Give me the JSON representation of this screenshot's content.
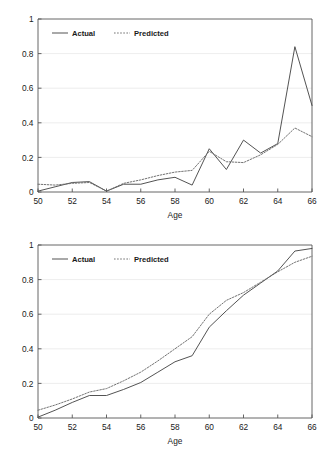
{
  "chart_data": [
    {
      "id": "top",
      "type": "line",
      "title": "",
      "xlabel": "Age",
      "ylabel": "",
      "xlim": [
        50,
        66
      ],
      "ylim": [
        0,
        1
      ],
      "xticks": [
        50,
        52,
        54,
        56,
        58,
        60,
        62,
        64,
        66
      ],
      "xtick_labels": [
        "50",
        "52",
        "54",
        "56",
        "58",
        "60",
        "62",
        "64",
        "66"
      ],
      "yticks": [
        0,
        0.2,
        0.4,
        0.6,
        0.8,
        1
      ],
      "ytick_labels": [
        "0",
        "0.2",
        "0.4",
        "0.6",
        "0.8",
        "1"
      ],
      "grid": "horizontal",
      "legend_position": "top-left",
      "x": [
        50,
        51,
        52,
        53,
        54,
        55,
        56,
        57,
        58,
        59,
        60,
        61,
        62,
        63,
        64,
        65,
        66
      ],
      "series": [
        {
          "name": "Actual",
          "style": "solid",
          "color": "#4a4a4a",
          "values": [
            0.005,
            0.03,
            0.055,
            0.06,
            0.005,
            0.045,
            0.045,
            0.07,
            0.085,
            0.04,
            0.25,
            0.13,
            0.3,
            0.225,
            0.28,
            0.84,
            0.5
          ]
        },
        {
          "name": "Predicted",
          "style": "dotted",
          "color": "#6b6b6b",
          "values": [
            0.045,
            0.04,
            0.05,
            0.055,
            0.005,
            0.05,
            0.07,
            0.095,
            0.115,
            0.125,
            0.235,
            0.175,
            0.17,
            0.215,
            0.275,
            0.37,
            0.32
          ]
        }
      ]
    },
    {
      "id": "bottom",
      "type": "line",
      "title": "",
      "xlabel": "Age",
      "ylabel": "",
      "xlim": [
        50,
        66
      ],
      "ylim": [
        0,
        1
      ],
      "xticks": [
        50,
        52,
        54,
        56,
        58,
        60,
        62,
        64,
        66
      ],
      "xtick_labels": [
        "50",
        "52",
        "54",
        "56",
        "58",
        "60",
        "62",
        "64",
        "66"
      ],
      "yticks": [
        0,
        0.2,
        0.4,
        0.6,
        0.8,
        1
      ],
      "ytick_labels": [
        "0",
        "0.2",
        "0.4",
        "0.6",
        "0.8",
        "1"
      ],
      "grid": "horizontal",
      "legend_position": "top-left",
      "x": [
        50,
        51,
        52,
        53,
        54,
        55,
        56,
        57,
        58,
        59,
        60,
        61,
        62,
        63,
        64,
        65,
        66
      ],
      "series": [
        {
          "name": "Actual",
          "style": "solid",
          "color": "#4a4a4a",
          "values": [
            0.005,
            0.045,
            0.09,
            0.13,
            0.13,
            0.165,
            0.205,
            0.265,
            0.325,
            0.36,
            0.525,
            0.62,
            0.71,
            0.78,
            0.85,
            0.965,
            0.98
          ]
        },
        {
          "name": "Predicted",
          "style": "dotted",
          "color": "#6b6b6b",
          "values": [
            0.045,
            0.075,
            0.11,
            0.15,
            0.17,
            0.215,
            0.265,
            0.33,
            0.4,
            0.47,
            0.6,
            0.68,
            0.725,
            0.785,
            0.845,
            0.9,
            0.935
          ]
        }
      ]
    }
  ],
  "legend": {
    "actual": "Actual",
    "predicted": "Predicted"
  },
  "colors": {
    "actual": "#4a4a4a",
    "predicted": "#6b6b6b",
    "axis": "#555555",
    "grid": "#e9e9e9",
    "background": "#ffffff"
  }
}
